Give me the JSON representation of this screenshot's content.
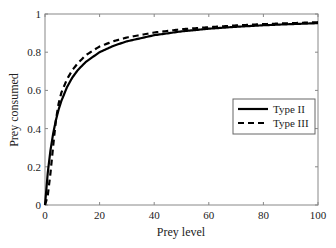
{
  "chart_data": {
    "type": "line",
    "title": "",
    "xlabel": "Prey level",
    "ylabel": "Prey consumed",
    "xlim": [
      0,
      100
    ],
    "ylim": [
      0,
      1
    ],
    "xticks": [
      0,
      20,
      40,
      60,
      80,
      100
    ],
    "yticks": [
      0,
      0.2,
      0.4,
      0.6,
      0.8,
      1
    ],
    "ytick_labels": [
      "0",
      "0.2",
      "0.4",
      "0.6",
      "0.8",
      "1"
    ],
    "grid": false,
    "legend_position": "right-center",
    "x": [
      0,
      1,
      2,
      3,
      4,
      5,
      6,
      8,
      10,
      12,
      15,
      20,
      25,
      30,
      40,
      50,
      60,
      70,
      80,
      90,
      100
    ],
    "series": [
      {
        "name": "Type II",
        "style": "solid",
        "color": "#000000",
        "values": [
          0.0,
          0.167,
          0.286,
          0.375,
          0.444,
          0.5,
          0.545,
          0.615,
          0.667,
          0.706,
          0.75,
          0.8,
          0.833,
          0.857,
          0.889,
          0.909,
          0.923,
          0.933,
          0.941,
          0.947,
          0.952
        ]
      },
      {
        "name": "Type III",
        "style": "dashed",
        "color": "#000000",
        "values": [
          0.0,
          0.048,
          0.167,
          0.31,
          0.444,
          0.532,
          0.588,
          0.657,
          0.706,
          0.742,
          0.785,
          0.83,
          0.857,
          0.877,
          0.903,
          0.92,
          0.931,
          0.94,
          0.947,
          0.952,
          0.957
        ]
      }
    ]
  },
  "legend": {
    "items": [
      {
        "label": "Type II",
        "style": "solid"
      },
      {
        "label": "Type III",
        "style": "dashed"
      }
    ]
  }
}
